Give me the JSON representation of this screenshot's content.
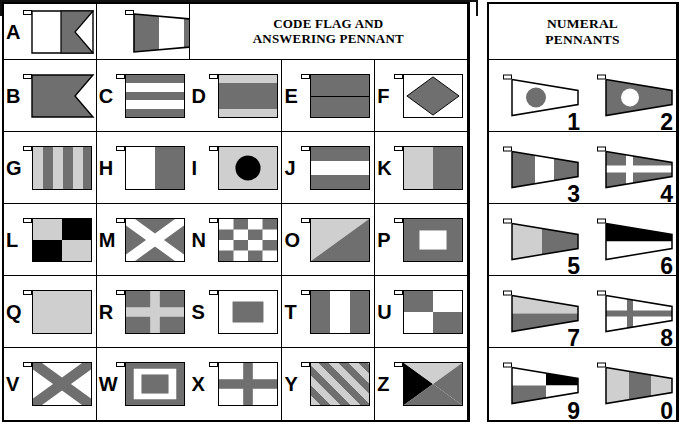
{
  "document": {
    "title": "International Code Flags and Numeral Pennants chart"
  },
  "colors": {
    "red": "#6f6f6f",
    "blue": "#6f6f6f",
    "yellow": "#cfcfcf",
    "white": "#ffffff",
    "black": "#000000",
    "outline": "#000000",
    "background": "#ffffff"
  },
  "alphabet_panel": {
    "header": {
      "line1": "CODE FLAG AND",
      "line2": "ANSWERING PENNANT"
    },
    "code_flag_label": "A",
    "answering_pennant_name": "answering-pennant",
    "flags": [
      {
        "letter": "B",
        "pattern": "swallowtail-red"
      },
      {
        "letter": "C",
        "pattern": "five-horizontal-stripes"
      },
      {
        "letter": "D",
        "pattern": "yellow-blue-yellow-horizontal"
      },
      {
        "letter": "E",
        "pattern": "blue-over-red"
      },
      {
        "letter": "F",
        "pattern": "white-with-red-diamond"
      },
      {
        "letter": "G",
        "pattern": "six-vertical-stripes"
      },
      {
        "letter": "H",
        "pattern": "white-red-vertical-halves"
      },
      {
        "letter": "I",
        "pattern": "yellow-with-black-circle"
      },
      {
        "letter": "J",
        "pattern": "blue-white-blue-horizontal"
      },
      {
        "letter": "K",
        "pattern": "yellow-blue-vertical"
      },
      {
        "letter": "L",
        "pattern": "yellow-black-quartered"
      },
      {
        "letter": "M",
        "pattern": "blue-with-white-saltire"
      },
      {
        "letter": "N",
        "pattern": "blue-white-checkerboard"
      },
      {
        "letter": "O",
        "pattern": "yellow-red-diagonal"
      },
      {
        "letter": "P",
        "pattern": "blue-with-white-rectangle"
      },
      {
        "letter": "Q",
        "pattern": "solid-yellow"
      },
      {
        "letter": "R",
        "pattern": "red-with-yellow-cross"
      },
      {
        "letter": "S",
        "pattern": "white-with-blue-rectangle"
      },
      {
        "letter": "T",
        "pattern": "red-white-blue-vertical"
      },
      {
        "letter": "U",
        "pattern": "red-white-quartered"
      },
      {
        "letter": "V",
        "pattern": "white-with-red-saltire"
      },
      {
        "letter": "W",
        "pattern": "blue-white-red-rectangles"
      },
      {
        "letter": "X",
        "pattern": "white-with-blue-cross"
      },
      {
        "letter": "Y",
        "pattern": "yellow-red-diagonal-stripes"
      },
      {
        "letter": "Z",
        "pattern": "four-triangles"
      }
    ]
  },
  "numeral_panel": {
    "header": {
      "line1": "NUMERAL",
      "line2": "PENNANTS"
    },
    "pennants": [
      {
        "numeral": "1",
        "pattern": "white-with-red-disc"
      },
      {
        "numeral": "2",
        "pattern": "blue-with-white-disc"
      },
      {
        "numeral": "3",
        "pattern": "red-white-red-vertical"
      },
      {
        "numeral": "4",
        "pattern": "red-with-white-cross"
      },
      {
        "numeral": "5",
        "pattern": "yellow-blue-vertical"
      },
      {
        "numeral": "6",
        "pattern": "black-over-white"
      },
      {
        "numeral": "7",
        "pattern": "yellow-over-red"
      },
      {
        "numeral": "8",
        "pattern": "white-with-red-cross"
      },
      {
        "numeral": "9",
        "pattern": "white-black-red-white-quarters"
      },
      {
        "numeral": "0",
        "pattern": "yellow-red-yellow-vertical"
      }
    ]
  }
}
